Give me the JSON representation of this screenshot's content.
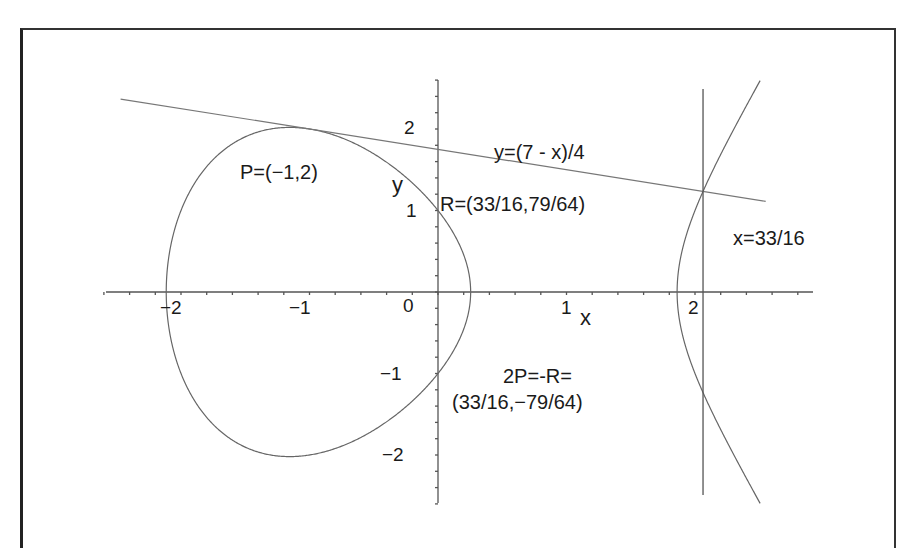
{
  "chart_data": {
    "type": "line",
    "title": "",
    "xlabel": "x",
    "ylabel": "y",
    "xlim": [
      -2.5,
      2.5
    ],
    "ylim": [
      -2.6,
      2.6
    ],
    "grid": false,
    "x_ticks": [
      "-2",
      "-1",
      "0",
      "1",
      "2"
    ],
    "y_ticks": [
      "2",
      "1",
      "-1",
      "-2"
    ],
    "series": [
      {
        "name": "elliptic curve y^2 = x^3 - 4x + 1",
        "kind": "curve"
      },
      {
        "name": "tangent line y=(7 - x)/4",
        "kind": "line",
        "points": [
          [
            -2.5,
            2.375
          ],
          [
            2.5,
            1.125
          ]
        ]
      },
      {
        "name": "vertical line x=33/16",
        "kind": "line",
        "points": [
          [
            2.0625,
            -2.5
          ],
          [
            2.0625,
            2.5
          ]
        ]
      }
    ],
    "points": [
      {
        "name": "P",
        "x": -1,
        "y": 2
      },
      {
        "name": "R",
        "x": 2.0625,
        "y": 1.234375
      },
      {
        "name": "2P",
        "x": 2.0625,
        "y": -1.234375
      }
    ],
    "annotations": {
      "p_label": "P=(−1,2)",
      "line_label": "y=(7 - x)/4",
      "r_label": "R=(33/16,79/64)",
      "vline_label": "x=33/16",
      "twop_label_1": "2P=-R=",
      "twop_label_2": "(33/16,−79/64)",
      "x_axis_label": "x",
      "y_axis_label": "y"
    },
    "tick_labels": {
      "xm2": "−2",
      "xm1": "−1",
      "x0": "0",
      "x1": "1",
      "x2": "2",
      "y2": "2",
      "y1": "1",
      "ym1": "−1",
      "ym2": "−2"
    }
  }
}
